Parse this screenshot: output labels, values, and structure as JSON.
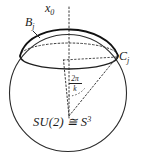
{
  "figure": {
    "name": "su2-sphere-cap-diagram",
    "background_color": "#ffffff",
    "stroke_color": "#262626"
  },
  "labels": {
    "axis": {
      "base": "x",
      "subscript": "0",
      "full": "x₀"
    },
    "cap": {
      "base": "B",
      "subscript": "j",
      "full": "Bⱼ"
    },
    "point": {
      "base": "C",
      "subscript": "j",
      "full": "Cⱼ"
    },
    "group": {
      "base": "SU(2) ≅ S",
      "superscript": "3",
      "full": "SU(2) ≅ S³"
    },
    "angle": {
      "numerator": "2π",
      "denominator": "k",
      "full": "2π/k"
    }
  },
  "geometry": {
    "sphere": {
      "cx": 68,
      "cy": 93,
      "r": 59
    },
    "cap_ellipse": {
      "cx": 69,
      "cy": 56,
      "rx": 49,
      "ry": 13
    },
    "cap_apex_y": 30,
    "axis": {
      "x": 69,
      "y_top": 6,
      "y_bottom": 118
    },
    "angle_vertex": {
      "x": 69,
      "y": 116
    }
  }
}
